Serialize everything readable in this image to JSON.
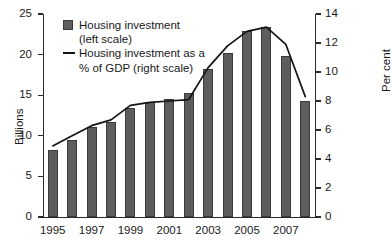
{
  "chart_data": {
    "type": "bar",
    "title": "",
    "xlabel": "",
    "ylabel": "Billions",
    "y2label": "Per cent",
    "grid": false,
    "legend_position": "top-left",
    "categories": [
      "1995",
      "1996",
      "1997",
      "1998",
      "1999",
      "2000",
      "2001",
      "2002",
      "2003",
      "2004",
      "2005",
      "2006",
      "2007",
      "2008"
    ],
    "xtick_labels": [
      "1995",
      "1997",
      "1999",
      "2001",
      "2003",
      "2005",
      "2007"
    ],
    "xtick_categories": [
      "1995",
      "1997",
      "1999",
      "2001",
      "2003",
      "2005",
      "2007"
    ],
    "ylim": [
      0,
      25
    ],
    "yticks": [
      0,
      5,
      10,
      15,
      20,
      25
    ],
    "y2lim": [
      0,
      14
    ],
    "y2ticks": [
      0,
      2,
      4,
      6,
      8,
      10,
      12,
      14
    ],
    "series": [
      {
        "name": "Housing investment (left scale)",
        "type": "bar",
        "axis": "left",
        "units": "Billions",
        "color": "#5d5d5d",
        "values": [
          8.2,
          9.5,
          11.1,
          11.7,
          13.4,
          14.2,
          14.5,
          15.3,
          18.2,
          20.2,
          22.9,
          23.4,
          19.8,
          14.3
        ]
      },
      {
        "name": "Housing investment as a % of GDP (right scale)",
        "type": "line",
        "axis": "right",
        "units": "Per cent",
        "color": "#141414",
        "values": [
          4.9,
          5.6,
          6.3,
          6.7,
          7.7,
          7.9,
          8.0,
          8.1,
          10.3,
          11.8,
          12.8,
          13.1,
          11.9,
          8.3
        ]
      }
    ]
  },
  "legend": {
    "bar_line1": "Housing investment",
    "bar_line2": "(left scale)",
    "line_line1": "Housing investment as a",
    "line_line2": "% of GDP (right scale)"
  },
  "axes": {
    "left_title": "Billions",
    "right_title": "Per cent"
  }
}
